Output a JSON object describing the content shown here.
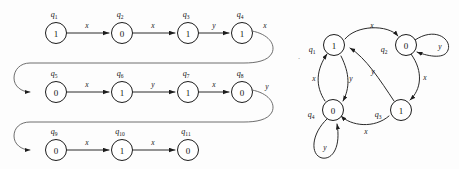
{
  "figure": {
    "background_color": "#fdfdfd",
    "ink_color": "#1c1c1c",
    "speck_mark": "·"
  },
  "left_diagram": {
    "name": "unrolled-state-trace",
    "type": "linear-chain-with-wraparound",
    "rows": [
      {
        "row_index": 1,
        "states": [
          {
            "id": "q1",
            "label": "q",
            "subscript": "1",
            "value": "1"
          },
          {
            "id": "q2",
            "label": "q",
            "subscript": "2",
            "value": "0"
          },
          {
            "id": "q3",
            "label": "q",
            "subscript": "3",
            "value": "1"
          },
          {
            "id": "q4",
            "label": "q",
            "subscript": "4",
            "value": "1"
          }
        ],
        "transitions": [
          {
            "from": "q1",
            "to": "q2",
            "symbol": "x"
          },
          {
            "from": "q2",
            "to": "q3",
            "symbol": "x"
          },
          {
            "from": "q3",
            "to": "q4",
            "symbol": "y"
          }
        ],
        "wrap_out": {
          "symbol": "x",
          "to": "q5"
        }
      },
      {
        "row_index": 2,
        "states": [
          {
            "id": "q5",
            "label": "q",
            "subscript": "5",
            "value": "0"
          },
          {
            "id": "q6",
            "label": "q",
            "subscript": "6",
            "value": "1"
          },
          {
            "id": "q7",
            "label": "q",
            "subscript": "7",
            "value": "1"
          },
          {
            "id": "q8",
            "label": "q",
            "subscript": "8",
            "value": "0"
          }
        ],
        "transitions": [
          {
            "from": "q5",
            "to": "q6",
            "symbol": "x"
          },
          {
            "from": "q6",
            "to": "q7",
            "symbol": "y"
          },
          {
            "from": "q7",
            "to": "q8",
            "symbol": "x"
          }
        ],
        "wrap_out": {
          "symbol": "y",
          "to": "q9"
        }
      },
      {
        "row_index": 3,
        "states": [
          {
            "id": "q9",
            "label": "q",
            "subscript": "9",
            "value": "0"
          },
          {
            "id": "q10",
            "label": "q",
            "subscript": "10",
            "value": "1"
          },
          {
            "id": "q11",
            "label": "q",
            "subscript": "11",
            "value": "0"
          }
        ],
        "transitions": [
          {
            "from": "q9",
            "to": "q10",
            "symbol": "x"
          },
          {
            "from": "q10",
            "to": "q11",
            "symbol": "x"
          }
        ],
        "wrap_out": null
      }
    ],
    "input_string": "x x y x x y x y x x",
    "output_string": "1 0 1 1 0 1 1 0 0 1 0"
  },
  "right_diagram": {
    "name": "state-transition-graph",
    "type": "directed-graph",
    "states": [
      {
        "id": "q1",
        "label": "q",
        "subscript": "1",
        "value": "1"
      },
      {
        "id": "q2",
        "label": "q",
        "subscript": "2",
        "value": "0"
      },
      {
        "id": "q3",
        "label": "q",
        "subscript": "3",
        "value": "1"
      },
      {
        "id": "q4",
        "label": "q",
        "subscript": "4",
        "value": "0"
      }
    ],
    "transitions": [
      {
        "from": "q1",
        "to": "q2",
        "symbol": "x"
      },
      {
        "from": "q1",
        "to": "q4",
        "symbol": "y"
      },
      {
        "from": "q2",
        "to": "q2",
        "symbol": "y",
        "self_loop": true
      },
      {
        "from": "q2",
        "to": "q3",
        "symbol": "x"
      },
      {
        "from": "q3",
        "to": "q1",
        "symbol": "y"
      },
      {
        "from": "q3",
        "to": "q4",
        "symbol": "x"
      },
      {
        "from": "q4",
        "to": "q1",
        "symbol": "x"
      },
      {
        "from": "q4",
        "to": "q4",
        "symbol": "y",
        "self_loop": true
      }
    ]
  }
}
